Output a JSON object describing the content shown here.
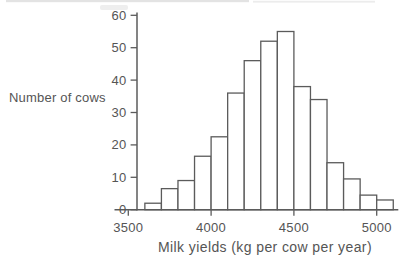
{
  "chart_data": {
    "type": "bar",
    "subtype": "histogram",
    "title": "",
    "xlabel": "Milk yields (kg per cow per year)",
    "ylabel": "Number of cows",
    "bin_start": 3600,
    "bin_width": 100,
    "bin_edges": [
      3600,
      3700,
      3800,
      3900,
      4000,
      4100,
      4200,
      4300,
      4400,
      4500,
      4600,
      4700,
      4800,
      4900,
      5000,
      5100
    ],
    "values": [
      2,
      6.5,
      9,
      16.5,
      22.5,
      36,
      46,
      52,
      55,
      38,
      34,
      14.5,
      9.5,
      4.5,
      3
    ],
    "xticks": [
      3500,
      4000,
      4500,
      5000
    ],
    "yticks": [
      0,
      10,
      20,
      30,
      40,
      50,
      60
    ],
    "xlim": [
      3500,
      5130
    ],
    "ylim": [
      0,
      60
    ],
    "grid": false,
    "legend": false,
    "bar_fill": "#ffffff",
    "line_color": "#5b5b5b",
    "text_color": "#555555",
    "background_color": "#ffffff"
  }
}
